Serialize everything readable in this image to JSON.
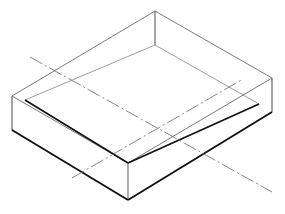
{
  "document": {
    "type": "technical-drawing",
    "projection": "isometric",
    "subject": "open rectangular shallow box / tray",
    "background_color": "#ffffff"
  },
  "canvas": {
    "width": 285,
    "height": 214
  },
  "styles": {
    "visible_edge_color": "#2b2b2b",
    "visible_edge_heavy_color": "#111111",
    "thin_edge_color": "#7d7d85",
    "interior_edge_color": "#8a8a92",
    "centerline_color": "#6f6f78",
    "visible_edge_width": 1.1,
    "heavy_edge_width": 1.9,
    "thin_edge_width": 0.85,
    "centerline_width": 0.85,
    "centerline_dash": "14 3 2 3"
  },
  "geometry": {
    "top_rim": {
      "label": "outer top rim parallelogram",
      "points": "12,96 155,11 272,78 128,163",
      "corners": {
        "left": [
          12,
          96
        ],
        "back": [
          155,
          11
        ],
        "right": [
          272,
          78
        ],
        "front": [
          128,
          163
        ]
      }
    },
    "wall_height": 37,
    "vertical_edges": [
      {
        "name": "left-corner-post",
        "x1": 12,
        "y1": 96,
        "x2": 12,
        "y2": 130
      },
      {
        "name": "back-corner-post",
        "x1": 155,
        "y1": 11,
        "x2": 155,
        "y2": 45
      },
      {
        "name": "right-corner-post",
        "x1": 272,
        "y1": 78,
        "x2": 272,
        "y2": 112
      },
      {
        "name": "inner-front-post",
        "x1": 128,
        "y1": 163,
        "x2": 128,
        "y2": 200
      }
    ],
    "bottom_outline": {
      "label": "outer bottom slab edges (heavy)",
      "left_edge": {
        "x1": 12,
        "y1": 130,
        "x2": 128,
        "y2": 200
      },
      "right_edge": {
        "x1": 128,
        "y1": 200,
        "x2": 272,
        "y2": 112
      }
    },
    "inner_floor": {
      "label": "inner floor parallelogram (cavity bottom)",
      "points": "25,100 155,45 259,104 128,163",
      "corners": {
        "left": [
          25,
          100
        ],
        "back": [
          155,
          45
        ],
        "right": [
          259,
          104
        ],
        "front": [
          128,
          163
        ]
      }
    },
    "back_wall_lines": [
      {
        "name": "back-left-top-rim",
        "x1": 12,
        "y1": 96,
        "x2": 155,
        "y2": 11
      },
      {
        "name": "back-right-top-rim",
        "x1": 155,
        "y1": 11,
        "x2": 272,
        "y2": 78
      },
      {
        "name": "front-left-top-rim",
        "x1": 12,
        "y1": 96,
        "x2": 128,
        "y2": 163
      },
      {
        "name": "front-right-top-rim",
        "x1": 128,
        "y1": 163,
        "x2": 272,
        "y2": 78
      }
    ],
    "centerlines": [
      {
        "name": "centerline-major",
        "description": "dash-dot axis running upper-left to lower-right",
        "x1": 30,
        "y1": 57,
        "x2": 272,
        "y2": 192
      },
      {
        "name": "centerline-minor",
        "description": "dash-dot axis running lower-left to upper-right",
        "x1": 72,
        "y1": 178,
        "x2": 243,
        "y2": 79
      }
    ]
  }
}
